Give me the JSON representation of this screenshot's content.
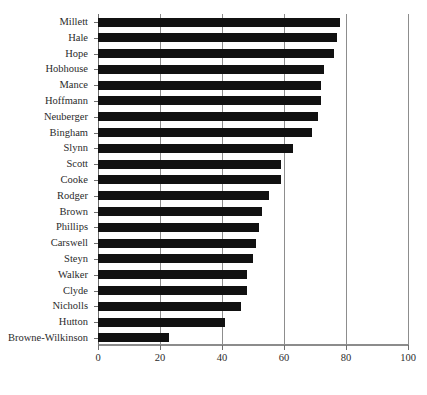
{
  "chart_data": {
    "type": "bar",
    "orientation": "horizontal",
    "title": "",
    "xlabel": "",
    "ylabel": "",
    "xlim": [
      0,
      100
    ],
    "xticks": [
      0,
      20,
      40,
      60,
      80,
      100
    ],
    "xtick_labels": [
      "0",
      "20",
      "40",
      "60",
      "80",
      "100"
    ],
    "grid": "vertical",
    "legend": "none",
    "bar_color": "#111111",
    "categories": [
      "Millett",
      "Hale",
      "Hope",
      "Hobhouse",
      "Mance",
      "Hoffmann",
      "Neuberger",
      "Bingham",
      "Slynn",
      "Scott",
      "Cooke",
      "Rodger",
      "Brown",
      "Phillips",
      "Carswell",
      "Steyn",
      "Walker",
      "Clyde",
      "Nicholls",
      "Hutton",
      "Browne-Wilkinson"
    ],
    "values": [
      78,
      77,
      76,
      73,
      72,
      72,
      71,
      69,
      63,
      59,
      59,
      55,
      53,
      52,
      51,
      50,
      48,
      48,
      46,
      41,
      23
    ]
  }
}
